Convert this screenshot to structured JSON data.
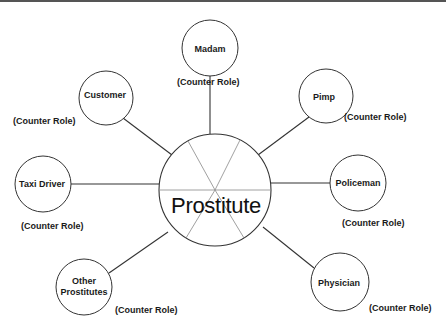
{
  "diagram": {
    "type": "role-set star diagram",
    "center": {
      "label": "Prostitute"
    },
    "counter_role_text": "(Counter Role)",
    "nodes": [
      {
        "id": "madam",
        "label": "Madam",
        "role_label": "(Counter Role)"
      },
      {
        "id": "customer",
        "label": "Customer",
        "role_label": "(Counter Role)"
      },
      {
        "id": "pimp",
        "label": "Pimp",
        "role_label": "(Counter Role)"
      },
      {
        "id": "taxi-driver",
        "label": "Taxi Driver",
        "role_label": "(Counter Role)"
      },
      {
        "id": "policeman",
        "label": "Policeman",
        "role_label": "(Counter Role)"
      },
      {
        "id": "other-prostitutes",
        "label": "Other\nProstitutes",
        "label_line1": "Other",
        "label_line2": "Prostitutes",
        "role_label": "(Counter Role)"
      },
      {
        "id": "physician",
        "label": "Physician",
        "role_label": "(Counter Role)"
      }
    ],
    "colors": {
      "stroke": "#333333",
      "inner_lines": "#888888",
      "background": "#ffffff",
      "top_border": "#555555"
    }
  }
}
